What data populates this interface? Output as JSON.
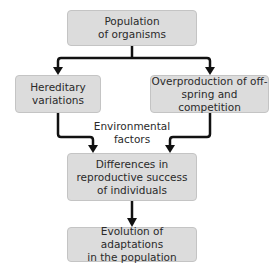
{
  "diagram": {
    "type": "flowchart",
    "nodes": {
      "population": "Population\nof organisms",
      "hereditary": "Hereditary\nvariations",
      "overproduction": "Overproduction of off-\nspring and competition",
      "differences": "Differences in\nreproductive success\nof individuals",
      "evolution": "Evolution of adaptations\nin the population"
    },
    "labels": {
      "environmental": "Environmental\nfactors"
    },
    "edges": [
      {
        "from": "population",
        "to": "hereditary"
      },
      {
        "from": "population",
        "to": "overproduction"
      },
      {
        "from": "hereditary",
        "to": "differences"
      },
      {
        "from": "overproduction",
        "to": "differences"
      },
      {
        "from": "differences",
        "to": "evolution"
      }
    ],
    "colors": {
      "box_fill": "#dcdcdc",
      "box_border": "#c4c4c4",
      "arrow": "#111111",
      "text": "#2a2a2a"
    }
  }
}
